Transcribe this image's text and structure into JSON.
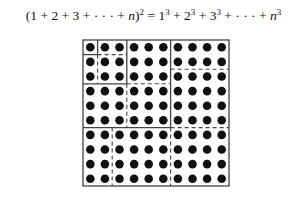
{
  "formula": {
    "lhs_open": "(1 + 2 + 3 + · · · + ",
    "lhs_var": "n",
    "lhs_close": ")",
    "lhs_exp": "2",
    "eq": " = ",
    "terms": [
      {
        "base": "1",
        "exp": "3",
        "sep": " + "
      },
      {
        "base": "2",
        "exp": "3",
        "sep": " + "
      },
      {
        "base": "3",
        "exp": "3",
        "sep": " + · · · + "
      }
    ],
    "last_base": "n",
    "last_exp": "3"
  },
  "grid": {
    "n": 4,
    "size": 10,
    "left": 83,
    "top": 40,
    "cell": 14.6,
    "dot_radius": 4.3,
    "dot_color": "#111111",
    "line_color": "#444444",
    "solid_lines": [
      [
        0,
        1,
        1,
        1
      ],
      [
        1,
        0,
        1,
        1
      ],
      [
        0,
        3,
        3,
        3
      ],
      [
        3,
        0,
        3,
        3
      ],
      [
        0,
        6,
        6,
        6
      ],
      [
        6,
        0,
        6,
        6
      ]
    ],
    "dashed_lines": [
      [
        1,
        1,
        3,
        1
      ],
      [
        1,
        1,
        1,
        3
      ],
      [
        3,
        3,
        6,
        3
      ],
      [
        3,
        3,
        3,
        6
      ],
      [
        6,
        2,
        10,
        2
      ],
      [
        2,
        6,
        2,
        10
      ],
      [
        6,
        6,
        10,
        6
      ],
      [
        6,
        6,
        6,
        10
      ]
    ]
  }
}
